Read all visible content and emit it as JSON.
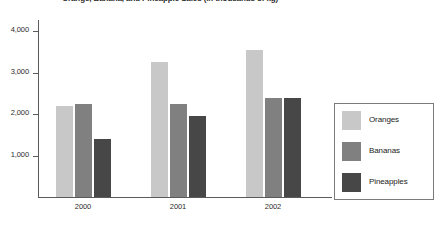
{
  "chart_data": {
    "type": "bar",
    "title": "Orange, Banana, and Pineapple Sales (in thousands of kg)",
    "xlabel": "",
    "ylabel": "",
    "categories": [
      "2000",
      "2001",
      "2002"
    ],
    "series": [
      {
        "name": "Oranges",
        "color": "#c8c8c8",
        "values": [
          2200,
          3250,
          3550
        ]
      },
      {
        "name": "Bananas",
        "color": "#808080",
        "values": [
          2250,
          2250,
          2400
        ]
      },
      {
        "name": "Pineapples",
        "color": "#474747",
        "values": [
          1400,
          1950,
          2400
        ]
      }
    ],
    "ylim": [
      0,
      4300
    ],
    "yticks": [
      1000,
      2000,
      3000,
      4000
    ],
    "ytick_labels": [
      "1,000",
      "2,000",
      "3,000",
      "4,000"
    ],
    "grid": false,
    "legend_position": "right",
    "grouping": "clustered"
  }
}
